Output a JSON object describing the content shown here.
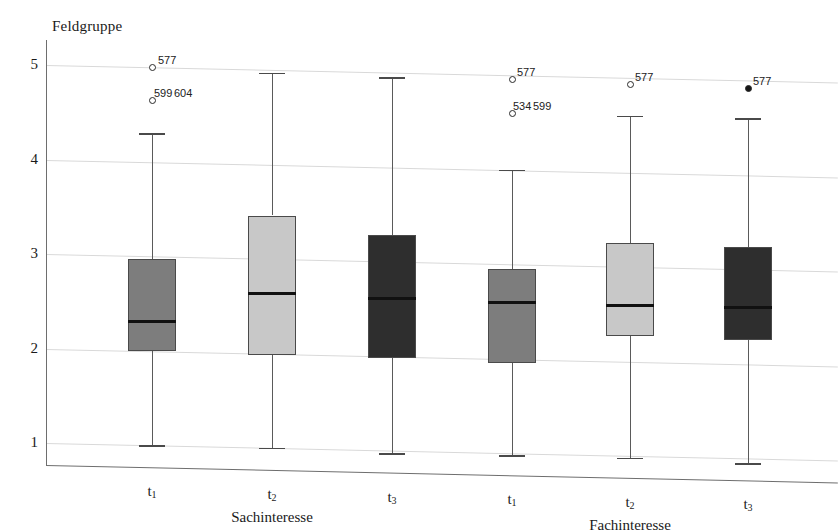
{
  "chart_data": {
    "type": "box",
    "title": "",
    "ylabel": "Feldgruppe",
    "xlabel": "",
    "ylim": [
      0.72,
      5.25
    ],
    "yticks": [
      1,
      2,
      3,
      4,
      5
    ],
    "ytick_labels": [
      "1",
      "2",
      "3",
      "4",
      "5"
    ],
    "grid": true,
    "legend": "none",
    "groups": [
      {
        "name": "Sachinteresse",
        "categories": [
          "t1",
          "t2",
          "t3"
        ]
      },
      {
        "name": "Fachinteresse",
        "categories": [
          "t1",
          "t2",
          "t3"
        ]
      }
    ],
    "category_labels": [
      "t",
      "t",
      "t",
      "t",
      "t",
      "t"
    ],
    "category_subscripts": [
      "1",
      "2",
      "3",
      "1",
      "2",
      "3"
    ],
    "boxes": [
      {
        "group": "Sachinteresse",
        "category": "t1",
        "whisker_low": 1.0,
        "q1": 2.0,
        "median": 2.32,
        "q3": 2.97,
        "whisker_high": 4.3,
        "fill": "#7d7d7d",
        "outliers": [
          {
            "value": 5.0,
            "label": "577",
            "filled": false,
            "label_dx": 6,
            "label_dy": -13
          },
          {
            "value": 4.65,
            "label": "599",
            "filled": false,
            "label_dx": 2,
            "label_dy": -13
          },
          {
            "value": 4.65,
            "label": "604",
            "filled": false,
            "label_dx": 22,
            "label_dy": -13,
            "hide_marker": true
          }
        ]
      },
      {
        "group": "Sachinteresse",
        "category": "t2",
        "whisker_low": 1.0,
        "q1": 1.98,
        "median": 2.64,
        "q3": 3.46,
        "whisker_high": 4.97,
        "fill": "#c8c8c8",
        "outliers": []
      },
      {
        "group": "Sachinteresse",
        "category": "t3",
        "whisker_low": 0.97,
        "q1": 1.98,
        "median": 2.62,
        "q3": 3.28,
        "whisker_high": 4.95,
        "fill": "#2e2e2e",
        "outliers": []
      },
      {
        "group": "Fachinteresse",
        "category": "t1",
        "whisker_low": 0.98,
        "q1": 1.96,
        "median": 2.6,
        "q3": 2.95,
        "whisker_high": 4.0,
        "fill": "#7d7d7d",
        "outliers": [
          {
            "value": 4.96,
            "label": "577",
            "filled": false,
            "label_dx": 5,
            "label_dy": -13
          },
          {
            "value": 4.6,
            "label": "534",
            "filled": false,
            "label_dx": 1,
            "label_dy": -13
          },
          {
            "value": 4.6,
            "label": "599",
            "filled": false,
            "label_dx": 21,
            "label_dy": -13,
            "hide_marker": true
          }
        ]
      },
      {
        "group": "Fachinteresse",
        "category": "t2",
        "whisker_low": 0.98,
        "q1": 2.27,
        "median": 2.6,
        "q3": 3.25,
        "whisker_high": 4.6,
        "fill": "#c8c8c8",
        "outliers": [
          {
            "value": 4.93,
            "label": "577",
            "filled": false,
            "label_dx": 5,
            "label_dy": -13
          }
        ]
      },
      {
        "group": "Fachinteresse",
        "category": "t3",
        "whisker_low": 0.95,
        "q1": 2.25,
        "median": 2.6,
        "q3": 3.24,
        "whisker_high": 4.6,
        "fill": "#2e2e2e",
        "outliers": [
          {
            "value": 4.92,
            "label": "577",
            "filled": true,
            "label_dx": 5,
            "label_dy": -13
          }
        ]
      }
    ],
    "colors": {
      "gridline": "#d9d9d9",
      "axis": "#6e6e6e",
      "median": "#111111",
      "box_border": "#4a4a4a",
      "series_medium_gray": "#7d7d7d",
      "series_light_gray": "#c8c8c8",
      "series_dark_gray": "#2e2e2e"
    }
  }
}
